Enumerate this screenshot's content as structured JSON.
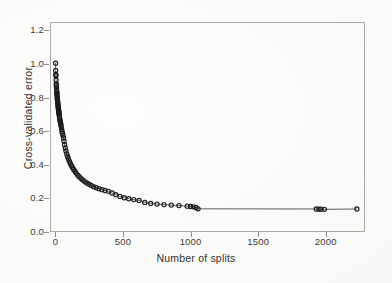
{
  "figure": {
    "background_color": "#fdfdfc",
    "frame_color": "#a9a9a6",
    "ink_color": "#1a1a1a"
  },
  "axes": {
    "x_title": "Number of splits",
    "y_title": "Cross-validated error",
    "x_ticks": [
      "0",
      "500",
      "1000",
      "1500",
      "2000"
    ],
    "y_ticks": [
      "0.0",
      "0.2",
      "0.4",
      "0.6",
      "0.8",
      "1.0",
      "1.2"
    ]
  },
  "page_bleed_text": "",
  "chart_data": {
    "type": "line",
    "title": "",
    "subtitle": "",
    "xlabel": "Number of splits",
    "ylabel": "Cross-validated error",
    "xlim": [
      -40,
      2290
    ],
    "ylim": [
      0.0,
      1.25
    ],
    "grid": false,
    "legend": null,
    "marker": "open-circle",
    "marker_size": 2.1,
    "line_color": "#1a1a1a",
    "series": [
      {
        "name": "cross-validated error",
        "x": [
          1,
          2,
          3,
          4,
          5,
          6,
          7,
          8,
          9,
          10,
          11,
          12,
          13,
          14,
          15,
          16,
          17,
          18,
          19,
          20,
          21,
          22,
          23,
          24,
          25,
          26,
          27,
          28,
          30,
          32,
          34,
          36,
          38,
          40,
          43,
          46,
          49,
          52,
          56,
          60,
          64,
          68,
          73,
          78,
          84,
          90,
          96,
          103,
          110,
          118,
          126,
          135,
          145,
          155,
          166,
          178,
          190,
          203,
          217,
          232,
          248,
          265,
          283,
          302,
          322,
          344,
          367,
          392,
          419,
          447,
          477,
          509,
          543,
          580,
          619,
          661,
          705,
          752,
          803,
          857,
          914,
          975,
          1000,
          1020,
          1040,
          1055,
          1930,
          1950,
          1965,
          1990,
          2230
        ],
        "y": [
          1.005,
          0.962,
          0.938,
          0.93,
          0.905,
          0.882,
          0.872,
          0.86,
          0.842,
          0.836,
          0.826,
          0.818,
          0.806,
          0.795,
          0.788,
          0.78,
          0.772,
          0.765,
          0.756,
          0.748,
          0.742,
          0.735,
          0.728,
          0.722,
          0.716,
          0.71,
          0.704,
          0.698,
          0.686,
          0.676,
          0.666,
          0.656,
          0.648,
          0.64,
          0.628,
          0.612,
          0.598,
          0.588,
          0.576,
          0.56,
          0.54,
          0.52,
          0.5,
          0.482,
          0.465,
          0.45,
          0.436,
          0.422,
          0.409,
          0.396,
          0.384,
          0.372,
          0.36,
          0.349,
          0.338,
          0.328,
          0.318,
          0.309,
          0.3,
          0.292,
          0.284,
          0.277,
          0.27,
          0.264,
          0.258,
          0.252,
          0.247,
          0.242,
          0.232,
          0.222,
          0.212,
          0.204,
          0.198,
          0.193,
          0.188,
          0.176,
          0.17,
          0.166,
          0.163,
          0.16,
          0.157,
          0.154,
          0.152,
          0.15,
          0.146,
          0.138,
          0.137,
          0.136,
          0.136,
          0.135,
          0.137
        ]
      }
    ]
  }
}
